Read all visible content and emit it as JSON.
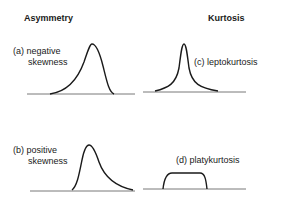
{
  "headers": {
    "left": "Asymmetry",
    "right": "Kurtosis"
  },
  "panels": [
    {
      "id": "a",
      "label_line1": "(a) negative",
      "label_line2": "skewness"
    },
    {
      "id": "c",
      "label_line1": "(c) leptokurtosis",
      "label_line2": ""
    },
    {
      "id": "b",
      "label_line1": "(b) positive",
      "label_line2": "skewness"
    },
    {
      "id": "d",
      "label_line1": "(d) platykurtosis",
      "label_line2": ""
    }
  ]
}
